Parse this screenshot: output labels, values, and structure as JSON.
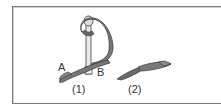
{
  "figure": {
    "labels": {
      "point_a": "A",
      "point_b": "B",
      "step1": "(1)",
      "step2": "(2)"
    },
    "colors": {
      "ribbon": "#777777",
      "ribbon_outline": "#333333",
      "pin": "#e6e6e6",
      "frame": "#7a7a7a"
    }
  }
}
